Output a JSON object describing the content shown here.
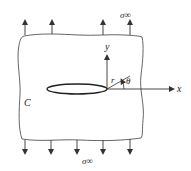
{
  "diagram": {
    "labels": {
      "stress_top": "σ∞",
      "stress_bottom": "σ∞",
      "axis_x": "x",
      "axis_y": "y",
      "radius": "r",
      "angle": "θ",
      "contour": "C"
    },
    "colors": {
      "stroke": "#333333",
      "background": "#ffffff"
    },
    "arrows": {
      "top_x": [
        25,
        52,
        103,
        130
      ],
      "bottom_x": [
        25,
        51,
        77,
        103,
        130
      ]
    }
  }
}
